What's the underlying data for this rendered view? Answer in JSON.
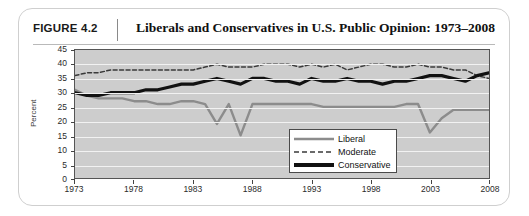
{
  "figure": {
    "label": "FIGURE 4.2",
    "title": "Liberals and Conservatives in U.S. Public Opinion: 1973–2008"
  },
  "chart_data": {
    "type": "line",
    "title": "Liberals and Conservatives in U.S. Public Opinion: 1973–2008",
    "xlabel": "",
    "ylabel": "Percent",
    "ylim": [
      0,
      45
    ],
    "ytick_values": [
      0,
      5,
      10,
      15,
      20,
      25,
      30,
      35,
      40,
      45
    ],
    "xlim": [
      1973,
      2008
    ],
    "xtick_labels": [
      "1973",
      "1978",
      "1983",
      "1988",
      "1993",
      "1998",
      "2003",
      "2008"
    ],
    "xtick_values": [
      1973,
      1978,
      1983,
      1988,
      1993,
      1998,
      2003,
      2008
    ],
    "grid": true,
    "legend_position": "lower-right-inside",
    "x": [
      1973,
      1974,
      1975,
      1976,
      1977,
      1978,
      1979,
      1980,
      1981,
      1982,
      1983,
      1984,
      1985,
      1986,
      1987,
      1988,
      1989,
      1990,
      1991,
      1992,
      1993,
      1994,
      1995,
      1996,
      1997,
      1998,
      1999,
      2000,
      2001,
      2002,
      2003,
      2004,
      2005,
      2006,
      2007,
      2008
    ],
    "series": [
      {
        "name": "Liberal",
        "color": "#8c8c8c",
        "style": "solid",
        "values": [
          31,
          29,
          28,
          28,
          28,
          27,
          27,
          26,
          26,
          27,
          27,
          26,
          19,
          26,
          15,
          26,
          26,
          26,
          26,
          26,
          26,
          25,
          25,
          25,
          25,
          25,
          25,
          25,
          26,
          26,
          16,
          21,
          24,
          24,
          24,
          24
        ]
      },
      {
        "name": "Moderate",
        "color": "#3a3a3a",
        "style": "dashed",
        "values": [
          36,
          37,
          37,
          38,
          38,
          38,
          38,
          38,
          38,
          38,
          38,
          39,
          40,
          39,
          39,
          39,
          40,
          40,
          40,
          39,
          40,
          39,
          40,
          38,
          39,
          40,
          40,
          39,
          39,
          40,
          39,
          39,
          38,
          38,
          36,
          35
        ]
      },
      {
        "name": "Conservative",
        "color": "#111111",
        "style": "thick-solid",
        "values": [
          30,
          29,
          29,
          30,
          30,
          30,
          31,
          31,
          32,
          33,
          33,
          34,
          35,
          34,
          33,
          35,
          35,
          34,
          34,
          33,
          35,
          34,
          34,
          35,
          34,
          34,
          33,
          34,
          34,
          35,
          36,
          36,
          35,
          34,
          36,
          37
        ]
      }
    ]
  },
  "legend": {
    "items": [
      {
        "label": "Liberal"
      },
      {
        "label": "Moderate"
      },
      {
        "label": "Conservative"
      }
    ]
  }
}
